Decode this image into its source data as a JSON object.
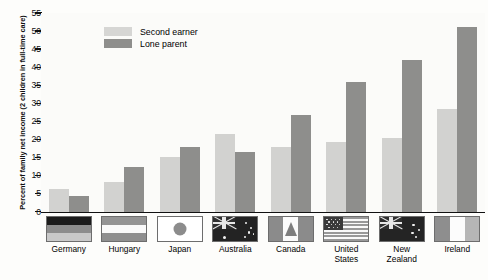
{
  "chart_data": {
    "type": "bar",
    "title": "",
    "xlabel": "",
    "ylabel": "Percent of family net income (2 children in full-time care)",
    "ylim": [
      0,
      55
    ],
    "ytick_labels": [
      "0",
      "5",
      "10",
      "15",
      "20",
      "25",
      "30",
      "35",
      "40",
      "45",
      "50",
      "55"
    ],
    "ytick_values": [
      0,
      5,
      10,
      15,
      20,
      25,
      30,
      35,
      40,
      45,
      50,
      55
    ],
    "grid": false,
    "legend_position": "upper-left-inside",
    "categories": [
      "Germany",
      "Hungary",
      "Japan",
      "Australia",
      "Canada",
      "United States",
      "New Zealand",
      "Ireland"
    ],
    "series": [
      {
        "name": "Second earner",
        "color": "#d2d2d0",
        "values": [
          6.3,
          8.2,
          15.0,
          21.6,
          17.8,
          19.2,
          20.5,
          28.3
        ]
      },
      {
        "name": "Lone parent",
        "color": "#8e8e8c",
        "values": [
          4.2,
          12.3,
          17.9,
          16.5,
          26.7,
          36.0,
          41.9,
          51.0
        ]
      }
    ]
  },
  "legend": {
    "items": [
      {
        "label": "Second earner",
        "color": "#d2d2d0"
      },
      {
        "label": "Lone parent",
        "color": "#8e8e8c"
      }
    ]
  },
  "axis": {
    "y_title": "Percent of family net income (2 children in full-time care)"
  },
  "countries": [
    {
      "name": "Germany",
      "flag": "germany-flag"
    },
    {
      "name": "Hungary",
      "flag": "hungary-flag"
    },
    {
      "name": "Japan",
      "flag": "japan-flag"
    },
    {
      "name": "Australia",
      "flag": "australia-flag"
    },
    {
      "name": "Canada",
      "flag": "canada-flag"
    },
    {
      "name": "United\nStates",
      "flag": "united-states-flag"
    },
    {
      "name": "New\nZealand",
      "flag": "new-zealand-flag"
    },
    {
      "name": "Ireland",
      "flag": "ireland-flag"
    }
  ]
}
